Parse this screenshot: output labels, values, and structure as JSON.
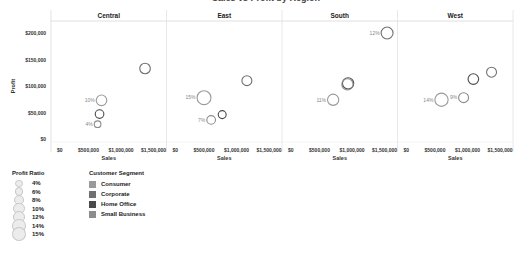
{
  "chart_data": {
    "type": "scatter",
    "title": "Sales vs Profit by Region",
    "xlabel": "Sales",
    "ylabel": "Profit",
    "xlim": [
      0,
      1650000
    ],
    "ylim": [
      0,
      215000
    ],
    "grid": false,
    "x_ticks": [
      0,
      500000,
      1000000,
      1500000
    ],
    "x_tick_labels": [
      "$0",
      "$500,000",
      "$1,000,000",
      "$1,500,000"
    ],
    "y_ticks": [
      0,
      50000,
      100000,
      150000,
      200000
    ],
    "y_tick_labels": [
      "$0",
      "$50,000",
      "$100,000",
      "$150,000",
      "$200,000"
    ],
    "facets": [
      "Central",
      "East",
      "South",
      "West"
    ],
    "size_legend": {
      "title": "Profit Ratio",
      "entries": [
        "4%",
        "6%",
        "8%",
        "10%",
        "12%",
        "14%",
        "15%"
      ],
      "values": [
        4,
        6,
        8,
        10,
        12,
        14,
        15
      ]
    },
    "color_legend": {
      "title": "Customer Segment",
      "entries": [
        {
          "label": "Consumer",
          "color": "#9a9a9a"
        },
        {
          "label": "Corporate",
          "color": "#707070"
        },
        {
          "label": "Home Office",
          "color": "#4a4a4a"
        },
        {
          "label": "Small Business",
          "color": "#8c8c8c"
        }
      ]
    },
    "points": [
      {
        "region": "Central",
        "sales": 1370000,
        "profit": 133000,
        "ratio": 10,
        "segment": "Corporate",
        "label": ""
      },
      {
        "region": "Central",
        "sales": 700000,
        "profit": 73000,
        "ratio": 10,
        "segment": "Consumer",
        "label": "10%"
      },
      {
        "region": "Central",
        "sales": 670000,
        "profit": 47000,
        "ratio": 7,
        "segment": "Home Office",
        "label": ""
      },
      {
        "region": "Central",
        "sales": 640000,
        "profit": 28000,
        "ratio": 4,
        "segment": "Small Business",
        "label": "4%"
      },
      {
        "region": "East",
        "sales": 1160000,
        "profit": 110000,
        "ratio": 9,
        "segment": "Corporate",
        "label": ""
      },
      {
        "region": "East",
        "sales": 500000,
        "profit": 78000,
        "ratio": 15,
        "segment": "Consumer",
        "label": "15%"
      },
      {
        "region": "East",
        "sales": 780000,
        "profit": 46000,
        "ratio": 6,
        "segment": "Home Office",
        "label": ""
      },
      {
        "region": "East",
        "sales": 610000,
        "profit": 36000,
        "ratio": 7,
        "segment": "Small Business",
        "label": "7%"
      },
      {
        "region": "South",
        "sales": 1540000,
        "profit": 200000,
        "ratio": 12,
        "segment": "Corporate",
        "label": "12%"
      },
      {
        "region": "South",
        "sales": 940000,
        "profit": 105000,
        "ratio": 11,
        "segment": "Home Office",
        "label": ""
      },
      {
        "region": "South",
        "sales": 930000,
        "profit": 103000,
        "ratio": 11,
        "segment": "Small Business",
        "label": ""
      },
      {
        "region": "South",
        "sales": 710000,
        "profit": 74000,
        "ratio": 11,
        "segment": "Consumer",
        "label": "11%"
      },
      {
        "region": "West",
        "sales": 1370000,
        "profit": 126000,
        "ratio": 9,
        "segment": "Corporate",
        "label": ""
      },
      {
        "region": "West",
        "sales": 1090000,
        "profit": 113000,
        "ratio": 10,
        "segment": "Home Office",
        "label": ""
      },
      {
        "region": "West",
        "sales": 940000,
        "profit": 78000,
        "ratio": 9,
        "segment": "Small Business",
        "label": "9%"
      },
      {
        "region": "West",
        "sales": 600000,
        "profit": 74000,
        "ratio": 14,
        "segment": "Consumer",
        "label": "14%"
      }
    ]
  }
}
